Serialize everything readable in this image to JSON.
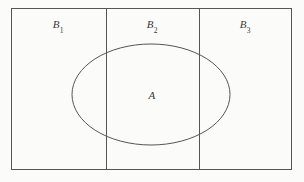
{
  "figure": {
    "kind": "set-partition-venn-diagram",
    "background_color": "#fbfbf9",
    "stroke_color": "#555555",
    "text_color": "#3a3a3a",
    "rectangle": {
      "x": 11,
      "y": 8,
      "width": 281,
      "height": 162
    },
    "dividers": [
      {
        "x": 106
      },
      {
        "x": 199
      }
    ],
    "ellipse": {
      "cx": 151,
      "cy": 94.5,
      "rx": 79,
      "ry": 50.5
    },
    "labels": {
      "b1": {
        "base": "B",
        "sub": "1"
      },
      "b2": {
        "base": "B",
        "sub": "2"
      },
      "b3": {
        "base": "B",
        "sub": "3"
      },
      "a": {
        "base": "A",
        "sub": ""
      }
    }
  }
}
